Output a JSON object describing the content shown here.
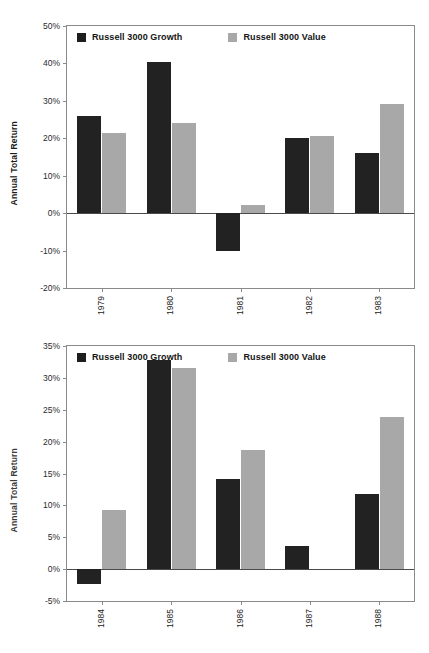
{
  "figure": {
    "series_names": [
      "Russell 3000 Growth",
      "Russell 3000 Value"
    ],
    "colors": {
      "growth": "#222222",
      "value": "#a8a8a8",
      "axis": "#8a8a8a"
    }
  },
  "legend": {
    "growth_label": "Russell 3000 Growth",
    "value_label": "Russell 3000 Value"
  },
  "chart_data": [
    {
      "id": "top",
      "type": "bar",
      "title": "",
      "xlabel": "",
      "ylabel": "Annual Total Return",
      "categories": [
        "1979",
        "1980",
        "1981",
        "1982",
        "1983"
      ],
      "series": [
        {
          "name": "Russell 3000 Growth",
          "color": "#222222",
          "values": [
            26.0,
            40.5,
            -10.2,
            20.2,
            16.1
          ]
        },
        {
          "name": "Russell 3000 Value",
          "color": "#a8a8a8",
          "values": [
            21.5,
            24.2,
            2.1,
            20.5,
            29.1
          ]
        }
      ],
      "ylim": [
        -20,
        50
      ],
      "ytick_step": 10,
      "yticks": [
        "50%",
        "40%",
        "30%",
        "20%",
        "10%",
        "0%",
        "-10%",
        "-20%"
      ],
      "ytick_values": [
        50,
        40,
        30,
        20,
        10,
        0,
        -10,
        -20
      ],
      "grid": false,
      "legend_position": "top-left-inside"
    },
    {
      "id": "bottom",
      "type": "bar",
      "title": "",
      "xlabel": "",
      "ylabel": "Annual Total Return",
      "categories": [
        "1984",
        "1985",
        "1986",
        "1987",
        "1988"
      ],
      "series": [
        {
          "name": "Russell 3000 Growth",
          "color": "#222222",
          "values": [
            -2.3,
            32.8,
            14.2,
            3.6,
            11.8
          ]
        },
        {
          "name": "Russell 3000 Value",
          "color": "#a8a8a8",
          "values": [
            9.2,
            31.5,
            18.7,
            0.0,
            23.8
          ]
        }
      ],
      "ylim": [
        -5,
        35
      ],
      "ytick_step": 5,
      "yticks": [
        "35%",
        "30%",
        "25%",
        "20%",
        "15%",
        "10%",
        "5%",
        "0%",
        "-5%"
      ],
      "ytick_values": [
        35,
        30,
        25,
        20,
        15,
        10,
        5,
        0,
        -5
      ],
      "grid": false,
      "legend_position": "top-left-inside"
    }
  ]
}
